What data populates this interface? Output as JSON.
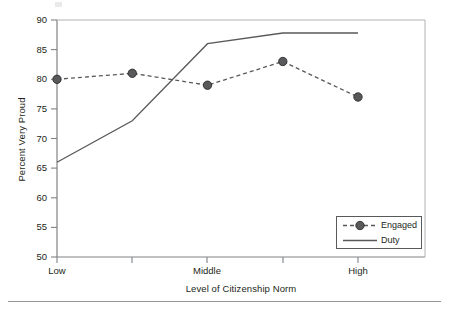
{
  "chart_data": {
    "type": "line",
    "title": "",
    "xlabel": "Level of Citizenship Norm",
    "ylabel": "Percent Very Proud",
    "xlim": [
      1,
      5
    ],
    "ylim": [
      50,
      90
    ],
    "yticks": [
      50,
      55,
      60,
      65,
      70,
      75,
      80,
      85,
      90
    ],
    "ytick_labels": [
      "50",
      "55",
      "60",
      "65",
      "70",
      "75",
      "80",
      "85",
      "90"
    ],
    "xticks": [
      1,
      2,
      3,
      4,
      5
    ],
    "xtick_labels": [
      "Low",
      "",
      "Middle",
      "",
      "High"
    ],
    "categories": [
      "Low",
      "",
      "Middle",
      "",
      "High"
    ],
    "grid": false,
    "legend_position": "lower right",
    "series": [
      {
        "name": "Engaged",
        "x": [
          1,
          2,
          3,
          4,
          5
        ],
        "values": [
          80,
          81,
          79,
          83,
          77
        ],
        "style": "dashed",
        "marker": "circle",
        "color": "#58595b"
      },
      {
        "name": "Duty",
        "x": [
          1,
          2,
          3,
          4,
          5
        ],
        "values": [
          66,
          73,
          86,
          87.8,
          87.8
        ],
        "style": "solid",
        "marker": "none",
        "color": "#58595b"
      }
    ]
  },
  "axes": {
    "y_title": "Percent Very Proud",
    "x_title": "Level of Citizenship Norm"
  },
  "legend": {
    "items": [
      {
        "label": "Engaged",
        "style": "dashed-marker"
      },
      {
        "label": "Duty",
        "style": "solid"
      }
    ]
  },
  "colors": {
    "line": "#58595b",
    "axis": "#808285",
    "text": "#231f20",
    "rule": "#939598"
  }
}
